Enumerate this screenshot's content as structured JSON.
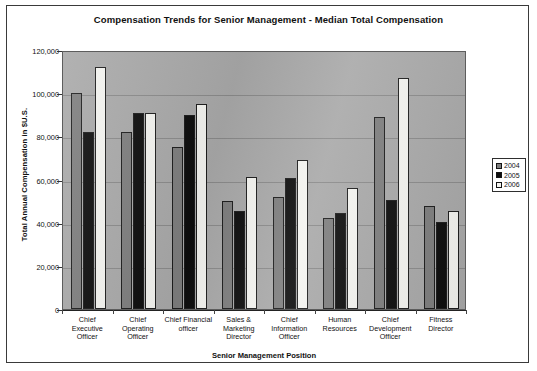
{
  "chart_data": {
    "type": "bar",
    "title": "Compensation Trends for Senior Management - Median Total Compensation",
    "xlabel": "Senior Management Position",
    "ylabel": "Total Annual Compensation in $U.S.",
    "ylim": [
      0,
      120000
    ],
    "ytick_labels": [
      "120,000",
      "100,000",
      "80,000",
      "60,000",
      "40,000",
      "20,000",
      "0"
    ],
    "ytick_values": [
      120000,
      100000,
      80000,
      60000,
      40000,
      20000,
      0
    ],
    "grid": true,
    "legend_position": "top-right inside plot",
    "categories": [
      "Chief Executive Officer",
      "Chief Operating Officer",
      "Chief Financial officer",
      "Sales & Marketing Director",
      "Chief Information Officer",
      "Human Resources",
      "Chief Development Officer",
      "Fitness Director"
    ],
    "category_lines": [
      [
        "Chief",
        "Executive",
        "Officer"
      ],
      [
        "Chief",
        "Operating",
        "Officer"
      ],
      [
        "Chief Financial",
        "officer"
      ],
      [
        "Sales &",
        "Marketing",
        "Director"
      ],
      [
        "Chief",
        "Information",
        "Officer"
      ],
      [
        "Human",
        "Resources"
      ],
      [
        "Chief",
        "Development",
        "Officer"
      ],
      [
        "Fitness",
        "Director"
      ]
    ],
    "series": [
      {
        "name": "2004",
        "color": "#7e7e7e",
        "values": [
          100000,
          82000,
          75000,
          50000,
          52000,
          42000,
          89000,
          47500
        ]
      },
      {
        "name": "2005",
        "color": "#0d0d0d",
        "values": [
          82000,
          91000,
          90000,
          45500,
          60500,
          44500,
          50500,
          40500
        ]
      },
      {
        "name": "2006",
        "color": "#f4f4f0",
        "values": [
          112000,
          91000,
          95000,
          61000,
          69000,
          56000,
          107000,
          45500
        ]
      }
    ]
  }
}
